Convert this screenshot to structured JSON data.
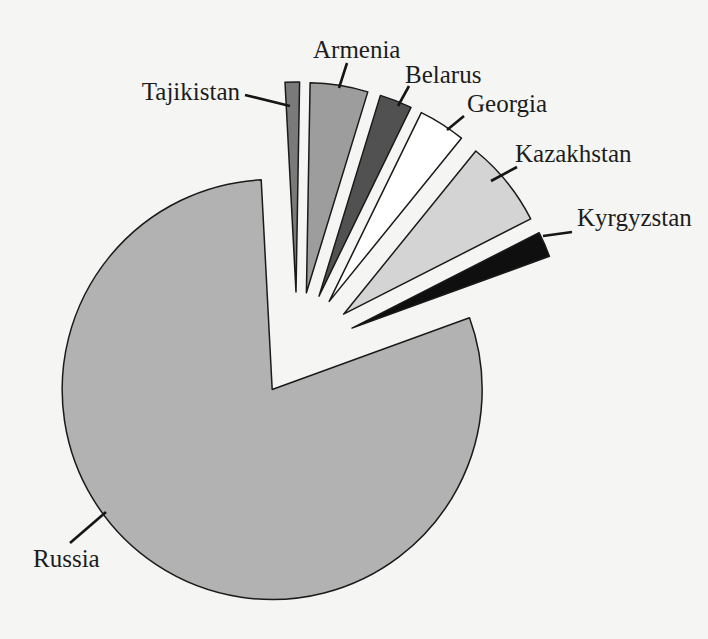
{
  "figure": {
    "kind": "scanned-book-pie-figure",
    "background_color": "#f5f5f3",
    "outline_color": "#1a1a1a",
    "text_color": "#1c1c1c",
    "leader_color": "#151515"
  },
  "chart_data": {
    "type": "pie",
    "title": "",
    "legend_position": "none — slices labeled directly with leader lines",
    "grid": "off",
    "categories": [
      "Tajikistan",
      "Armenia",
      "Belarus",
      "Georgia",
      "Kazakhstan",
      "Kyrgyzstan",
      "Russia"
    ],
    "values_pct_estimated": [
      1.1,
      4.4,
      2.5,
      3.6,
      6.7,
      1.9,
      79.7
    ],
    "geometry": {
      "center": {
        "x": 297,
        "y": 352
      },
      "radius": 210
    },
    "slices": [
      {
        "label": "Tajikistan",
        "value_pct_est": 1.1,
        "start_deg": 93,
        "end_deg": 89,
        "explode_px": 60,
        "fill": "#7a7a7a",
        "label_pos": {
          "x": 240,
          "y": 100,
          "anchor": "end"
        },
        "leader": {
          "x1": 245,
          "y1": 95,
          "x2": 290,
          "y2": 106
        }
      },
      {
        "label": "Armenia",
        "value_pct_est": 4.4,
        "start_deg": 89,
        "end_deg": 73,
        "explode_px": 60,
        "fill": "#9d9d9d",
        "label_pos": {
          "x": 313,
          "y": 58,
          "anchor": "start"
        },
        "leader": {
          "x1": 347,
          "y1": 63,
          "x2": 339,
          "y2": 88
        }
      },
      {
        "label": "Belarus",
        "value_pct_est": 2.5,
        "start_deg": 73,
        "end_deg": 64,
        "explode_px": 60,
        "fill": "#515151",
        "label_pos": {
          "x": 405,
          "y": 83,
          "anchor": "start"
        },
        "leader": {
          "x1": 409,
          "y1": 86,
          "x2": 398,
          "y2": 106
        }
      },
      {
        "label": "Georgia",
        "value_pct_est": 3.6,
        "start_deg": 64,
        "end_deg": 51,
        "explode_px": 60,
        "fill": "#ffffff",
        "label_pos": {
          "x": 467,
          "y": 112,
          "anchor": "start"
        },
        "leader": {
          "x1": 464,
          "y1": 116,
          "x2": 447,
          "y2": 130
        }
      },
      {
        "label": "Kazakhstan",
        "value_pct_est": 6.7,
        "start_deg": 51,
        "end_deg": 27,
        "explode_px": 60,
        "fill": "#d4d4d4",
        "label_pos": {
          "x": 515,
          "y": 162,
          "anchor": "start"
        },
        "leader": {
          "x1": 517,
          "y1": 167,
          "x2": 491,
          "y2": 181
        }
      },
      {
        "label": "Kyrgyzstan",
        "value_pct_est": 1.9,
        "start_deg": 27,
        "end_deg": 20,
        "explode_px": 60,
        "fill": "#0f0f0f",
        "label_pos": {
          "x": 577,
          "y": 226,
          "anchor": "start"
        },
        "leader": {
          "x1": 543,
          "y1": 236,
          "x2": 572,
          "y2": 232
        }
      },
      {
        "label": "Russia",
        "value_pct_est": 79.7,
        "start_deg": 20,
        "end_deg": -267,
        "explode_px": 45,
        "fill": "#b2b2b2",
        "label_pos": {
          "x": 33,
          "y": 567,
          "anchor": "start"
        },
        "leader": {
          "x1": 70,
          "y1": 543,
          "x2": 106,
          "y2": 512
        }
      }
    ]
  }
}
